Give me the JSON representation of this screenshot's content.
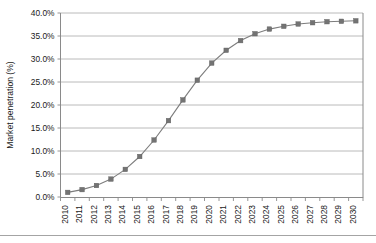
{
  "chart_data": {
    "type": "line",
    "title": "",
    "xlabel": "",
    "ylabel": "Market penetration (%)",
    "ylim": [
      0,
      40
    ],
    "ytick_values": [
      0,
      5,
      10,
      15,
      20,
      25,
      30,
      35,
      40
    ],
    "ytick_labels": [
      "0.0%",
      "5.0%",
      "10.0%",
      "15.0%",
      "20.0%",
      "25.0%",
      "30.0%",
      "35.0%",
      "40.0%"
    ],
    "grid": "horizontal",
    "legend": "none",
    "marker": "square",
    "series_color": "#737373",
    "categories": [
      "2010",
      "2011",
      "2012",
      "2013",
      "2014",
      "2015",
      "2016",
      "2017",
      "2018",
      "2019",
      "2020",
      "2021",
      "2022",
      "2023",
      "2024",
      "2025",
      "2026",
      "2027",
      "2028",
      "2029",
      "2030"
    ],
    "series": [
      {
        "name": "Market penetration",
        "values": [
          1.0,
          1.6,
          2.5,
          3.9,
          6.0,
          8.8,
          12.4,
          16.6,
          21.1,
          25.4,
          29.1,
          31.9,
          34.0,
          35.5,
          36.5,
          37.1,
          37.6,
          37.9,
          38.1,
          38.2,
          38.3
        ]
      }
    ]
  },
  "figure": {
    "y_axis_title": "Market penetration (%)"
  }
}
